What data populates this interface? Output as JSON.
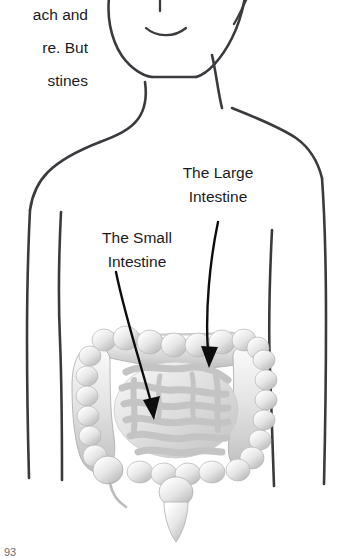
{
  "page": {
    "width": 356,
    "height": 558,
    "background": "#ffffff",
    "ink_color": "#3b3b3f",
    "text_color": "#1b1b1f",
    "arrow_color": "#0d0d0d"
  },
  "body_text": {
    "note": "Left column paragraph text, clipped by the left page edge",
    "lines": [
      "ach and",
      "re. But",
      "stines"
    ]
  },
  "labels": {
    "large_intestine": {
      "line1": "The Large",
      "line2": "Intestine"
    },
    "small_intestine": {
      "line1": "The Small",
      "line2": "Intestine"
    }
  },
  "footer": {
    "page_number": "93"
  },
  "figure": {
    "parts": [
      "head-outline",
      "mouth",
      "nose",
      "chin",
      "neck",
      "shoulders",
      "left-arm",
      "right-arm",
      "torso",
      "large-intestine",
      "small-intestine",
      "cecum",
      "appendix",
      "rectum"
    ]
  }
}
